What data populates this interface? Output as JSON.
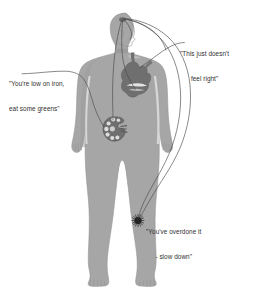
{
  "figure": {
    "background_color": "#ffffff",
    "body_fill": "#a6a6a6",
    "body_outline": "#8f8f8f",
    "organ_fill": "#6e6e6e",
    "line_color": "#4a4a4a",
    "text_color": "#303030"
  },
  "callouts": [
    {
      "id": "iron",
      "name": "kidney-callout",
      "line1": "\"You're low on iron,",
      "line2": "eat some greens\"",
      "anchor_organ": "kidney"
    },
    {
      "id": "heart",
      "name": "heart-callout",
      "line1": "\"This just doesn't",
      "line2": "feel right\"",
      "anchor_organ": "heart"
    },
    {
      "id": "leg",
      "name": "leg-callout",
      "line1": "\"You've overdone it",
      "line2": "- slow down\"",
      "anchor_organ": "leg-pain-point"
    }
  ],
  "anatomy": {
    "organs": [
      {
        "name": "brain-node",
        "label": "brain"
      },
      {
        "name": "heart-organ",
        "label": "heart"
      },
      {
        "name": "kidney-organ",
        "label": "kidney"
      },
      {
        "name": "leg-pain-burst",
        "label": "leg pain point"
      }
    ]
  }
}
